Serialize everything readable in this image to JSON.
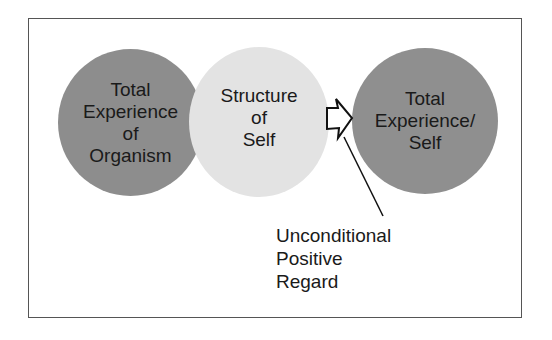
{
  "diagram": {
    "nodes": [
      {
        "id": "organism",
        "lines": [
          "Total",
          "Experience",
          "of",
          "Organism"
        ],
        "fill": "#8d8d8d"
      },
      {
        "id": "self_structure",
        "lines": [
          "Structure",
          "of",
          "Self"
        ],
        "fill": "#e3e3e3"
      },
      {
        "id": "total_self",
        "lines": [
          "Total",
          "Experience/",
          "Self"
        ],
        "fill": "#8f8f8f"
      }
    ],
    "arrow": {
      "from": "self_structure",
      "to": "total_self",
      "style": "hollow-block-arrow"
    },
    "annotation": {
      "lines": [
        "Unconditional",
        "Positive",
        "Regard"
      ],
      "points_to": "arrow"
    }
  }
}
